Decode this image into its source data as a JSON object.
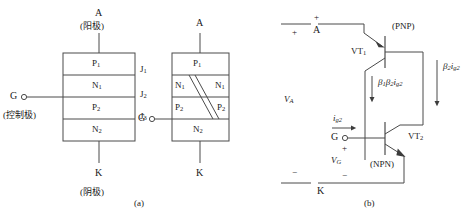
{
  "figure": {
    "title_a": "(a)",
    "title_b": "(b)"
  },
  "structure_diagram": {
    "anode_label": "A",
    "anode_cn": "(阳极)",
    "gate_label": "G",
    "gate_cn": "(控制极)",
    "cathode_label": "K",
    "cathode_cn": "(阴极)",
    "layers": [
      {
        "name": "P",
        "sub": "1"
      },
      {
        "name": "N",
        "sub": "1"
      },
      {
        "name": "P",
        "sub": "2"
      },
      {
        "name": "N",
        "sub": "2"
      }
    ],
    "junctions": [
      {
        "name": "J",
        "sub": "1"
      },
      {
        "name": "J",
        "sub": "2"
      },
      {
        "name": "J",
        "sub": "3"
      }
    ]
  },
  "split_diagram": {
    "anode_label": "A",
    "gate_label": "G",
    "cathode_label": "K",
    "top_layer": {
      "name": "P",
      "sub": "1"
    },
    "mid_left": [
      {
        "name": "N",
        "sub": "1"
      },
      {
        "name": "P",
        "sub": "2"
      }
    ],
    "mid_right": [
      {
        "name": "N",
        "sub": "1"
      },
      {
        "name": "P",
        "sub": "2"
      }
    ],
    "bottom_layer": {
      "name": "N",
      "sub": "2"
    }
  },
  "circuit_diagram": {
    "anode_label": "A",
    "gate_label": "G",
    "cathode_label": "K",
    "transistor1": {
      "name": "VT",
      "sub": "1",
      "type": "(PNP)"
    },
    "transistor2": {
      "name": "VT",
      "sub": "2",
      "type": "(NPN)"
    },
    "voltage_anode": {
      "name": "V",
      "sub": "A"
    },
    "voltage_gate": {
      "name": "V",
      "sub": "G"
    },
    "current_gate": {
      "name": "i",
      "sub": "g2"
    },
    "current_beta12": {
      "beta1": "β",
      "b1sub": "1",
      "beta2": "β",
      "b2sub": "2",
      "cur": "i",
      "cursub": "g2"
    },
    "current_beta2": {
      "beta": "β",
      "bsub": "2",
      "cur": "i",
      "cursub": "g2"
    },
    "plus_left": "+",
    "minus_left": "−",
    "plus_anode": "+",
    "plus_gate": "+",
    "minus_gate": "−",
    "minus_cathode": "−"
  },
  "colors": {
    "line": "#4a4a4a",
    "text": "#1a1a1a",
    "background": "#ffffff"
  }
}
